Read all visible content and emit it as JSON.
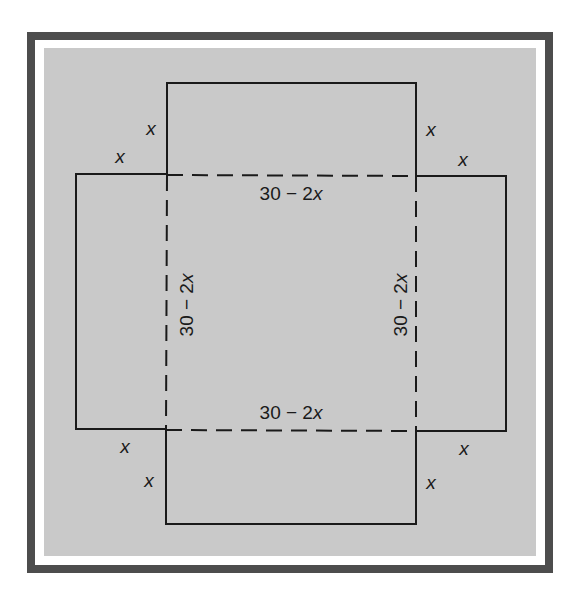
{
  "diagram": {
    "colors": {
      "frame": "#4d4d4d",
      "fill": "#c9c9c9",
      "line": "#1a1a1a"
    },
    "side_labels": {
      "top": {
        "expr": "30 − 2",
        "var": "x"
      },
      "bottom": {
        "expr": "30 − 2",
        "var": "x"
      },
      "left": {
        "expr": "30 − 2",
        "var": "x"
      },
      "right": {
        "expr": "30 − 2",
        "var": "x"
      }
    },
    "corner_labels": {
      "top_left_1": "x",
      "top_left_2": "x",
      "top_right_1": "x",
      "top_right_2": "x",
      "bottom_left_1": "x",
      "bottom_left_2": "x",
      "bottom_right_1": "x",
      "bottom_right_2": "x"
    }
  }
}
